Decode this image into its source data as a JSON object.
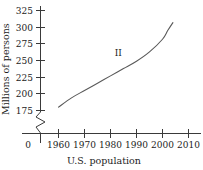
{
  "chart_data": {
    "type": "line",
    "title": "",
    "xlabel": "U.S. population",
    "ylabel": "Millions of persons",
    "grid": false,
    "legend": "none",
    "x_tick_labels": [
      "0",
      "1960",
      "1970",
      "1980",
      "1990",
      "2000",
      "2010"
    ],
    "y_tick_labels": [
      "175",
      "200",
      "225",
      "250",
      "275",
      "300",
      "325"
    ],
    "xlim": [
      1955,
      2014
    ],
    "ylim": [
      175,
      325
    ],
    "y_axis_break": true,
    "y_axis_break_note": "zigzag break between 0 and 175",
    "series": [
      {
        "name": "II",
        "label": "II",
        "label_x": 1983,
        "label_y": 262,
        "x": [
          1960,
          1965,
          1970,
          1975,
          1980,
          1985,
          1990,
          1995,
          2000,
          2002,
          2004
        ],
        "values": [
          180,
          194,
          205,
          216,
          227,
          238,
          249,
          263,
          282,
          295,
          307
        ]
      }
    ],
    "colors": {
      "curve": "#595959",
      "axis": "#3a3a3a",
      "text": "#1c1c1c",
      "background": "#ffffff"
    }
  }
}
